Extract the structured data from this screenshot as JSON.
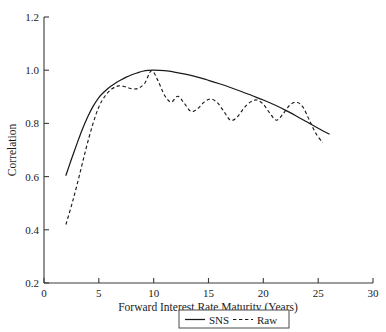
{
  "chart_data": {
    "type": "line",
    "title": "",
    "xlabel": "Forward Interest Rate Maturity (Years)",
    "ylabel": "Correlation",
    "xlim": [
      0,
      30
    ],
    "ylim": [
      0.2,
      1.2
    ],
    "xticks": [
      0,
      5,
      10,
      15,
      20,
      25,
      30
    ],
    "xtick_labels": [
      "0",
      "5",
      "10",
      "15",
      "20",
      "25",
      "30"
    ],
    "yticks": [
      0.2,
      0.4,
      0.6,
      0.8,
      1.0,
      1.2
    ],
    "ytick_labels": [
      "0.2",
      "0.4",
      "0.6",
      "0.8",
      "1.0",
      "1.2"
    ],
    "grid": false,
    "legend_position": "below-center",
    "series": [
      {
        "name": "SNS",
        "style": "solid",
        "color": "#1a1a1a",
        "x": [
          2.0,
          2.5,
          3.0,
          3.5,
          4.0,
          4.5,
          5.0,
          5.5,
          6.0,
          6.5,
          7.0,
          7.5,
          8.0,
          8.5,
          9.0,
          9.5,
          10.0,
          11.0,
          12.0,
          13.0,
          14.0,
          15.0,
          16.0,
          17.0,
          18.0,
          19.0,
          20.0,
          21.0,
          22.0,
          23.0,
          24.0,
          25.0,
          26.0
        ],
        "y": [
          0.605,
          0.665,
          0.723,
          0.778,
          0.826,
          0.866,
          0.897,
          0.919,
          0.937,
          0.951,
          0.963,
          0.974,
          0.983,
          0.99,
          0.996,
          0.999,
          1.0,
          0.998,
          0.992,
          0.984,
          0.974,
          0.962,
          0.949,
          0.935,
          0.92,
          0.904,
          0.888,
          0.87,
          0.85,
          0.828,
          0.805,
          0.782,
          0.76
        ]
      },
      {
        "name": "Raw",
        "style": "dashed",
        "color": "#1a1a1a",
        "x": [
          2.0,
          2.6,
          3.2,
          3.8,
          4.4,
          5.0,
          5.6,
          6.2,
          6.8,
          7.4,
          8.0,
          8.6,
          9.2,
          9.8,
          10.4,
          11.0,
          11.6,
          12.2,
          12.8,
          13.4,
          14.0,
          14.6,
          15.2,
          15.8,
          16.4,
          17.0,
          17.6,
          18.2,
          18.8,
          19.4,
          20.0,
          20.6,
          21.2,
          21.8,
          22.4,
          23.0,
          23.6,
          24.2,
          24.8,
          25.4
        ],
        "y": [
          0.42,
          0.505,
          0.6,
          0.7,
          0.79,
          0.862,
          0.905,
          0.93,
          0.941,
          0.938,
          0.93,
          0.932,
          0.952,
          0.998,
          0.96,
          0.905,
          0.88,
          0.902,
          0.875,
          0.845,
          0.855,
          0.88,
          0.892,
          0.878,
          0.845,
          0.812,
          0.823,
          0.856,
          0.88,
          0.888,
          0.872,
          0.838,
          0.812,
          0.836,
          0.868,
          0.88,
          0.862,
          0.812,
          0.762,
          0.728
        ]
      }
    ]
  },
  "legend": {
    "entries": [
      {
        "label": "SNS",
        "style": "solid"
      },
      {
        "label": "Raw",
        "style": "dashed"
      }
    ]
  }
}
